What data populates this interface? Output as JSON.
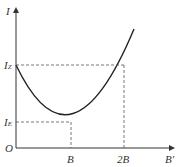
{
  "axes": {
    "y_label": "I",
    "x_label": "B'",
    "origin_label": "O"
  },
  "y_ticks": [
    {
      "main": "I",
      "sub": "Z"
    },
    {
      "main": "I",
      "sub": "E"
    }
  ],
  "x_ticks": [
    "B",
    "2B"
  ],
  "colors": {
    "curve": "#222222",
    "axis": "#333333",
    "dashed": "#555555"
  }
}
